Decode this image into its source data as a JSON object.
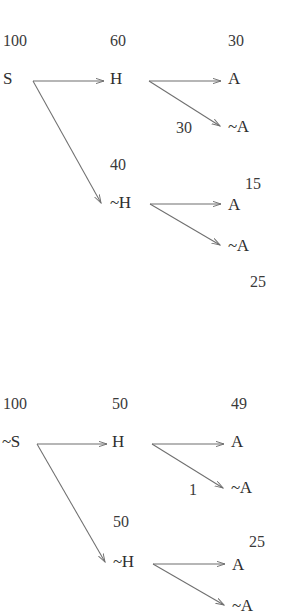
{
  "figure": {
    "type": "tree-diagram",
    "stroke_color": "#6f6f6f",
    "text_color": "#2e2e2e",
    "background_color": "#ffffff"
  },
  "trees": [
    {
      "id": "tree-top",
      "root": {
        "label": "S",
        "count": "100"
      },
      "level1": [
        {
          "label": "H",
          "count": "60"
        },
        {
          "label": "~H",
          "count": "40"
        }
      ],
      "level2": [
        {
          "label": "A",
          "count": "30",
          "parent": "H"
        },
        {
          "label": "~A",
          "count": "30",
          "parent": "H"
        },
        {
          "label": "A",
          "count": "15",
          "parent": "~H"
        },
        {
          "label": "~A",
          "count": "25",
          "parent": "~H"
        }
      ]
    },
    {
      "id": "tree-bottom",
      "root": {
        "label": "~S",
        "count": "100"
      },
      "level1": [
        {
          "label": "H",
          "count": "50"
        },
        {
          "label": "~H",
          "count": "50"
        }
      ],
      "level2": [
        {
          "label": "A",
          "count": "49",
          "parent": "H"
        },
        {
          "label": "~A",
          "count": "1",
          "parent": "H"
        },
        {
          "label": "A",
          "count": "25",
          "parent": "~H"
        },
        {
          "label": "~A",
          "count": "",
          "parent": "~H"
        }
      ]
    }
  ],
  "labels": {
    "t1_c_root": "100",
    "t1_n_root": "S",
    "t1_c_h": "60",
    "t1_n_h": "H",
    "t1_c_a1": "30",
    "t1_n_a1": "A",
    "t1_c_na1": "30",
    "t1_n_na1": "~A",
    "t1_c_nh": "40",
    "t1_n_nh": "~H",
    "t1_c_a2": "15",
    "t1_n_a2": "A",
    "t1_n_na2": "~A",
    "t1_c_na2": "25",
    "t2_c_root": "100",
    "t2_n_root": "~S",
    "t2_c_h": "50",
    "t2_n_h": "H",
    "t2_c_a1": "49",
    "t2_n_a1": "A",
    "t2_c_na1": "1",
    "t2_n_na1": "~A",
    "t2_c_nh": "50",
    "t2_n_nh": "~H",
    "t2_c_a2": "25",
    "t2_n_a2": "A",
    "t2_n_na2": "~A"
  }
}
